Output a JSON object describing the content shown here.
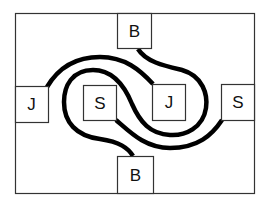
{
  "diagram": {
    "type": "connection-puzzle",
    "boxes": [
      {
        "id": "top-b",
        "label": "B",
        "x": 117,
        "y": 13,
        "w": 34,
        "h": 35
      },
      {
        "id": "left-j",
        "label": "J",
        "x": 15,
        "y": 86,
        "w": 33,
        "h": 36
      },
      {
        "id": "center-s",
        "label": "S",
        "x": 83,
        "y": 85,
        "w": 33,
        "h": 35
      },
      {
        "id": "center-j",
        "label": "J",
        "x": 152,
        "y": 84,
        "w": 33,
        "h": 36
      },
      {
        "id": "right-s",
        "label": "S",
        "x": 221,
        "y": 84,
        "w": 33,
        "h": 36
      },
      {
        "id": "bottom-b",
        "label": "B",
        "x": 117,
        "y": 156,
        "w": 36,
        "h": 37
      }
    ],
    "connections": [
      {
        "from": "top-b",
        "to": "bottom-b"
      },
      {
        "from": "left-j",
        "to": "center-j"
      },
      {
        "from": "center-s",
        "to": "right-s"
      }
    ]
  }
}
